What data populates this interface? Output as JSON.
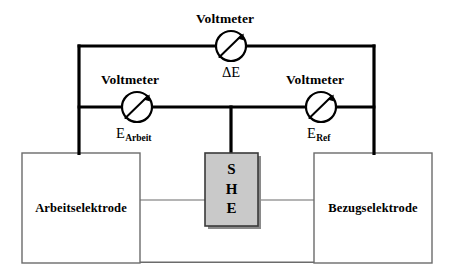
{
  "diagram": {
    "background_color": "#ffffff",
    "wire_color": "#000000",
    "thin_wire_color": "#6b6b6b"
  },
  "meters": {
    "top": {
      "label": "Voltmeter",
      "symbol_prefix": "ΔE",
      "symbol_sub": "",
      "icon": "voltmeter-gauge-icon",
      "cx": 231,
      "cy": 46,
      "r": 15
    },
    "left": {
      "label": "Voltmeter",
      "symbol_prefix": "E",
      "symbol_sub": "Arbeit",
      "icon": "voltmeter-gauge-icon",
      "cx": 137,
      "cy": 107,
      "r": 15
    },
    "right": {
      "label": "Voltmeter",
      "symbol_prefix": "E",
      "symbol_sub": "Ref",
      "icon": "voltmeter-gauge-icon",
      "cx": 321,
      "cy": 107,
      "r": 15
    }
  },
  "electrodes": {
    "working": {
      "label": "Arbeitselektrode",
      "fill": "#ffffff",
      "stroke": "#6b6b6b"
    },
    "reference": {
      "label": "Bezugselektrode",
      "fill": "#ffffff",
      "stroke": "#6b6b6b"
    },
    "she": {
      "letters": [
        "S",
        "H",
        "E"
      ],
      "full_name": "SHE",
      "fill": "#c9c9c9",
      "stroke": "#3a3a3a",
      "shadow": "#8a8a8a"
    }
  }
}
